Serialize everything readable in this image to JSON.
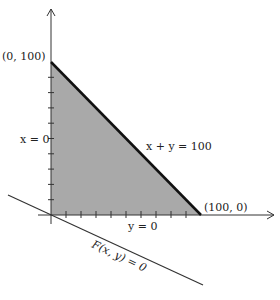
{
  "diagram": {
    "type": "feasible-region-plot",
    "colors": {
      "region_fill": "#a9a9a9",
      "axis": "#333333",
      "constraint_line": "#111111",
      "objective_line": "#333333",
      "background": "#ffffff"
    },
    "labels": {
      "point_top": "(0, 100)",
      "point_right": "(100, 0)",
      "x_zero": "x = 0",
      "y_zero": "y = 0",
      "constraint": "x + y = 100",
      "objective": "F(x, y) = 0"
    },
    "axes": {
      "x_ticks": 10,
      "y_ticks": 10
    },
    "region_vertices": [
      [
        0,
        0
      ],
      [
        100,
        0
      ],
      [
        0,
        100
      ]
    ]
  }
}
